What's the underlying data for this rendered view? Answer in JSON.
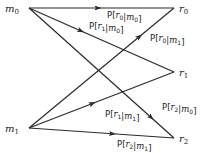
{
  "diagram": {
    "title": "",
    "type": "bipartite channel transition diagram",
    "line_color": "#2a2a2a",
    "text_color": "#222222",
    "inputs": [
      {
        "id": "m0",
        "base": "m",
        "sub": "0",
        "x": 21,
        "y": 8
      },
      {
        "id": "m1",
        "base": "m",
        "sub": "1",
        "x": 21,
        "y": 128
      }
    ],
    "outputs": [
      {
        "id": "r0",
        "base": "r",
        "sub": "0",
        "x": 178,
        "y": 8
      },
      {
        "id": "r1",
        "base": "r",
        "sub": "1",
        "x": 178,
        "y": 72
      },
      {
        "id": "r2",
        "base": "r",
        "sub": "2",
        "x": 178,
        "y": 138
      }
    ],
    "edges": [
      {
        "from": "m0",
        "to": "r0",
        "label": "P[r0|m0]",
        "r": "0",
        "m": "0",
        "arrow_t": 0.5,
        "label_x": 107,
        "label_y": 18
      },
      {
        "from": "m0",
        "to": "r1",
        "label": "P[r1|m0]",
        "r": "1",
        "m": "0",
        "arrow_t": 0.38,
        "label_x": 89,
        "label_y": 29
      },
      {
        "from": "m0",
        "to": "r2",
        "label": "P[r2|m0]",
        "r": "2",
        "m": "0",
        "arrow_t": 0.86,
        "label_x": 162,
        "label_y": 110
      },
      {
        "from": "m1",
        "to": "r0",
        "label": "P[r0|m1]",
        "r": "0",
        "m": "1",
        "arrow_t": 0.78,
        "label_x": 150,
        "label_y": 41
      },
      {
        "from": "m1",
        "to": "r1",
        "label": "P[r1|m1]",
        "r": "1",
        "m": "1",
        "arrow_t": 0.46,
        "label_x": 105,
        "label_y": 117
      },
      {
        "from": "m1",
        "to": "r2",
        "label": "P[r2|m1]",
        "r": "2",
        "m": "1",
        "arrow_t": 0.6,
        "label_x": 117,
        "label_y": 147
      }
    ]
  }
}
